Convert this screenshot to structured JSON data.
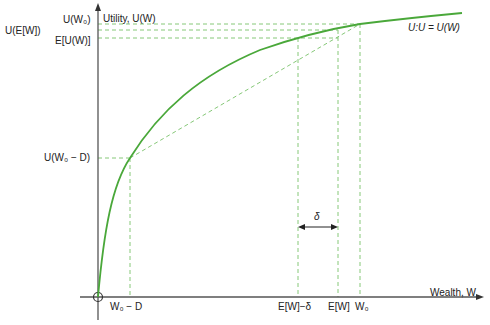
{
  "axes": {
    "y_label": "Utility, U(W)",
    "x_label": "Wealth, W"
  },
  "y_ticks": [
    {
      "label": "U(W₀)",
      "y": 24
    },
    {
      "label": "U(E[W])",
      "y": 30
    },
    {
      "label": "E[U(W)]",
      "y": 38
    },
    {
      "label": "U(W₀ − D)",
      "y": 158
    }
  ],
  "x_ticks": [
    {
      "label": "W₀ − D",
      "x": 130
    },
    {
      "label": "E[W]−δ",
      "x": 298
    },
    {
      "label": "E[W]",
      "x": 338
    },
    {
      "label": "W₀",
      "x": 360
    }
  ],
  "curve_label": "U:U = U(W)",
  "delta_label": "δ",
  "colors": {
    "curve": "#4aa83a",
    "guide": "#7cc46a",
    "axis": "#555555"
  }
}
